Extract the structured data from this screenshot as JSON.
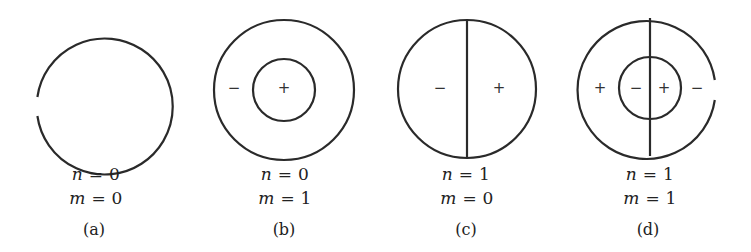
{
  "figure": {
    "stroke_color": "#2a2a2a",
    "panels": [
      {
        "id": "a",
        "caption": "(a)",
        "n_label": "n = 0",
        "m_label": "m = 0",
        "n_var": "n",
        "n_val": " = 0",
        "m_var": "m",
        "m_val": " = 0",
        "signs": []
      },
      {
        "id": "b",
        "caption": "(b)",
        "n_label": "n = 0",
        "m_label": "m = 1",
        "n_var": "n",
        "n_val": " = 0",
        "m_var": "m",
        "m_val": " = 1",
        "signs": [
          "−",
          "+"
        ]
      },
      {
        "id": "c",
        "caption": "(c)",
        "n_label": "n = 1",
        "m_label": "m = 0",
        "n_var": "n",
        "n_val": " = 1",
        "m_var": "m",
        "m_val": " = 0",
        "signs": [
          "−",
          "+"
        ]
      },
      {
        "id": "d",
        "caption": "(d)",
        "n_label": "n = 1",
        "m_label": "m = 1",
        "n_var": "n",
        "n_val": " = 1",
        "m_var": "m",
        "m_val": " = 1",
        "signs": [
          "+",
          "−",
          "+",
          "−"
        ]
      }
    ]
  }
}
